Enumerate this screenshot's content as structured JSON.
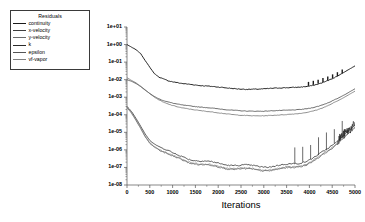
{
  "legend": {
    "title": "Residuals",
    "items": [
      {
        "label": "continuity",
        "color": "#1a1a1a"
      },
      {
        "label": "x-velocity",
        "color": "#3d3d3d"
      },
      {
        "label": "y-velocity",
        "color": "#6b6b6b"
      },
      {
        "label": "k",
        "color": "#2a2a2a"
      },
      {
        "label": "epsilon",
        "color": "#555555"
      },
      {
        "label": "vf-vapor",
        "color": "#808080"
      }
    ]
  },
  "axes": {
    "xlabel": "Iterations",
    "ylabel": "",
    "xticks": [
      "0",
      "500",
      "1000",
      "1500",
      "2000",
      "2500",
      "3000",
      "3500",
      "4000",
      "4500",
      "5000"
    ],
    "yticks": [
      "1e+01",
      "1e+00",
      "1e-01",
      "1e-02",
      "1e-03",
      "1e-04",
      "1e-05",
      "1e-06",
      "1e-07",
      "1e-08"
    ]
  },
  "chart_data": {
    "type": "line",
    "title": "",
    "xlabel": "Iterations",
    "ylabel": "",
    "xlim": [
      0,
      5000
    ],
    "ylim": [
      1e-08,
      10.0
    ],
    "yscale": "log",
    "grid": false,
    "legend_position": "outside-upper-left",
    "x": [
      0,
      100,
      200,
      300,
      400,
      500,
      600,
      700,
      800,
      900,
      1000,
      1200,
      1400,
      1600,
      1800,
      2000,
      2200,
      2400,
      2600,
      2800,
      3000,
      3200,
      3400,
      3600,
      3800,
      4000,
      4200,
      4400,
      4600,
      4800,
      5000
    ],
    "series": [
      {
        "name": "continuity",
        "color": "#1a1a1a",
        "values": [
          1.0,
          0.7,
          0.5,
          0.3,
          0.12,
          0.05,
          0.022,
          0.014,
          0.011,
          0.009,
          0.008,
          0.0065,
          0.0055,
          0.0045,
          0.004,
          0.0036,
          0.0033,
          0.0031,
          0.003,
          0.003,
          0.003,
          0.0031,
          0.0032,
          0.0034,
          0.0038,
          0.0045,
          0.006,
          0.009,
          0.015,
          0.03,
          0.06
        ]
      },
      {
        "name": "x-velocity",
        "color": "#3d3d3d",
        "values": [
          0.01,
          0.008,
          0.006,
          0.004,
          0.0025,
          0.0016,
          0.0011,
          0.0008,
          0.00065,
          0.00055,
          0.00048,
          0.00038,
          0.00032,
          0.00027,
          0.00024,
          0.00021,
          0.00019,
          0.00018,
          0.00017,
          0.000165,
          0.00016,
          0.000165,
          0.00017,
          0.00018,
          0.0002,
          0.00024,
          0.00032,
          0.00048,
          0.0008,
          0.0015,
          0.003
        ]
      },
      {
        "name": "y-velocity",
        "color": "#6b6b6b",
        "values": [
          0.013,
          0.009,
          0.0065,
          0.0042,
          0.0026,
          0.0016,
          0.001,
          0.0007,
          0.00052,
          0.00042,
          0.00035,
          0.00026,
          0.00021,
          0.00017,
          0.000145,
          0.000125,
          0.00011,
          0.0001,
          9.5e-05,
          9e-05,
          8.8e-05,
          9e-05,
          9.5e-05,
          0.000105,
          0.00012,
          0.00015,
          0.00021,
          0.00033,
          0.00058,
          0.0011,
          0.0022
        ]
      },
      {
        "name": "k",
        "color": "#2a2a2a",
        "values": [
          0.0003,
          0.00015,
          6e-05,
          2.2e-05,
          8e-06,
          3.5e-06,
          2.2e-06,
          1.6e-06,
          1.2e-06,
          9e-07,
          6e-07,
          4.2e-07,
          3e-07,
          2.4e-07,
          2e-07,
          1.7e-07,
          1.5e-07,
          1.35e-07,
          1.25e-07,
          1.18e-07,
          1.15e-07,
          1.2e-07,
          1.3e-07,
          1.5e-07,
          1.9e-07,
          2.8e-07,
          5e-07,
          1.1e-06,
          3e-06,
          9e-06,
          2.5e-05
        ]
      },
      {
        "name": "epsilon",
        "color": "#555555",
        "values": [
          0.00026,
          0.00012,
          4.5e-05,
          1.6e-05,
          5.5e-06,
          2.4e-06,
          1.5e-06,
          1.05e-06,
          7.5e-07,
          5.5e-07,
          4e-07,
          2.7e-07,
          1.9e-07,
          1.5e-07,
          1.25e-07,
          1.05e-07,
          9.2e-08,
          8.3e-08,
          7.6e-08,
          7.2e-08,
          7e-08,
          7.3e-08,
          8e-08,
          9.3e-08,
          1.2e-07,
          1.8e-07,
          3.3e-07,
          7.5e-07,
          2.1e-06,
          6.5e-06,
          1.8e-05
        ]
      },
      {
        "name": "vf-vapor",
        "color": "#808080",
        "values": [
          0.00028,
          0.00013,
          5e-05,
          1.8e-05,
          6e-06,
          2.6e-06,
          1.6e-06,
          1.1e-06,
          8e-07,
          6e-07,
          4.4e-07,
          3e-07,
          2.1e-07,
          1.65e-07,
          1.35e-07,
          1.15e-07,
          1e-07,
          9e-08,
          8.3e-08,
          7.9e-08,
          7.7e-08,
          8e-08,
          8.7e-08,
          1e-07,
          1.3e-07,
          2e-07,
          3.6e-07,
          8e-07,
          2.3e-06,
          7e-06,
          2e-05
        ]
      }
    ],
    "annotations": [
      {
        "kind": "spikes",
        "series": "continuity",
        "x_range": [
          3980,
          4720
        ],
        "count": 8
      },
      {
        "kind": "spikes",
        "series": "k",
        "x_range": [
          3680,
          4720
        ],
        "count": 7
      },
      {
        "kind": "noise-cluster",
        "series": "k",
        "x_range": [
          4620,
          5000
        ]
      }
    ]
  }
}
